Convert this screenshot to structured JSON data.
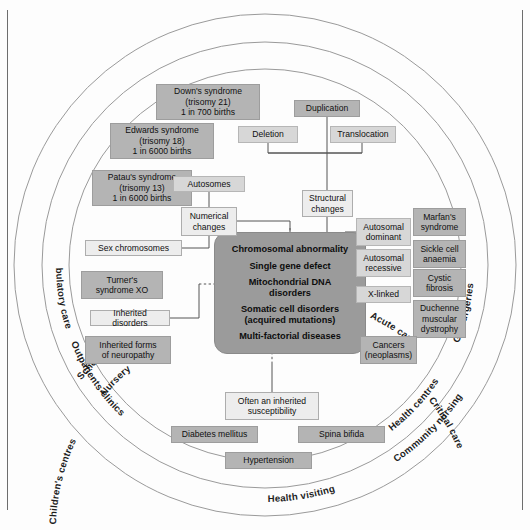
{
  "figure": {
    "type": "concentric-ring concept map"
  },
  "rings": {
    "outer_labels": [
      "Home",
      "Acute care",
      "Critical care",
      "Ambulatory care",
      "Outpatients clinics",
      "Community nursing",
      "Health visiting",
      "Health centres",
      "GP surgeries",
      "Children's centres",
      "Nursery",
      "School"
    ]
  },
  "core": {
    "lines": [
      "Chromosomal abnormality",
      "Single gene defect",
      "Mitochondrial DNA\ndisorders",
      "Somatic cell disorders\n(acquired mutations)",
      "Multi-factorial diseases"
    ]
  },
  "nodes": [
    {
      "id": "downs",
      "label": "Down's syndrome\n(trisomy 21)\n1 in 700 births",
      "tone": "mid"
    },
    {
      "id": "edwards",
      "label": "Edwards syndrome\n(trisomy 18)\n1 in 6000 births",
      "tone": "mid"
    },
    {
      "id": "patau",
      "label": "Patau's syndrome\n(trisomy 13)\n1 in 6000 births",
      "tone": "mid"
    },
    {
      "id": "autosomes",
      "label": "Autosomes",
      "tone": "light"
    },
    {
      "id": "numerical",
      "label": "Numerical\nchanges",
      "tone": "pale"
    },
    {
      "id": "sexchrom",
      "label": "Sex chromosomes",
      "tone": "pale"
    },
    {
      "id": "turners",
      "label": "Turner's\nsyndrome XO",
      "tone": "mid"
    },
    {
      "id": "inherited",
      "label": "Inherited disorders",
      "tone": "pale"
    },
    {
      "id": "neuropathy",
      "label": "Inherited forms\nof neuropathy",
      "tone": "mid"
    },
    {
      "id": "duplication",
      "label": "Duplication",
      "tone": "mid"
    },
    {
      "id": "deletion",
      "label": "Deletion",
      "tone": "light"
    },
    {
      "id": "translocation",
      "label": "Translocation",
      "tone": "light"
    },
    {
      "id": "structural",
      "label": "Structural\nchanges",
      "tone": "pale"
    },
    {
      "id": "autodom",
      "label": "Autosomal\ndominant",
      "tone": "light"
    },
    {
      "id": "autorec",
      "label": "Autosomal\nrecessive",
      "tone": "light"
    },
    {
      "id": "xlinked",
      "label": "X-linked",
      "tone": "light"
    },
    {
      "id": "marfan",
      "label": "Marfan's\nsyndrome",
      "tone": "mid"
    },
    {
      "id": "sickle",
      "label": "Sickle cell\nanaemia",
      "tone": "mid"
    },
    {
      "id": "cystic",
      "label": "Cystic\nfibrosis",
      "tone": "mid"
    },
    {
      "id": "duchenne",
      "label": "Duchenne\nmuscular\ndystrophy",
      "tone": "mid"
    },
    {
      "id": "cancers",
      "label": "Cancers\n(neoplasms)",
      "tone": "mid"
    },
    {
      "id": "suscept",
      "label": "Often an inherited\nsusceptibility",
      "tone": "pale"
    },
    {
      "id": "diabetes",
      "label": "Diabetes mellitus",
      "tone": "mid"
    },
    {
      "id": "spina",
      "label": "Spina bifida",
      "tone": "mid"
    },
    {
      "id": "hypertension",
      "label": "Hypertension",
      "tone": "mid"
    }
  ],
  "colors": {
    "core_fill": "#9b9b9b",
    "mid_fill": "#b4b4b4",
    "light_fill": "#d7d7d7",
    "pale_fill": "#ededed",
    "connector": "#555555",
    "ring_stroke": "#9a9a9a"
  }
}
